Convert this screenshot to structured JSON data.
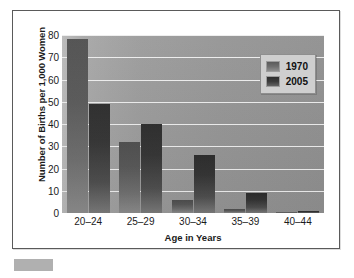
{
  "figure": {
    "background_color": "#ffffff",
    "border_color": "#5a5a5a",
    "plot_background_color": "#9a9a9a",
    "gridline_color": "#ededed"
  },
  "legend": {
    "position": "upper-right",
    "background_color": "#cfcfcf",
    "entries": [
      {
        "label": "1970",
        "color": "#6e6e6e"
      },
      {
        "label": "2005",
        "color": "#3c3c3c"
      }
    ]
  },
  "bottom_marker": {
    "name": "gray-block",
    "color": "#b0b0b0"
  },
  "chart_data": {
    "type": "bar",
    "title": "",
    "xlabel": "Age in Years",
    "ylabel": "Number of Births per 1,000 Women",
    "categories": [
      "20–24",
      "25–29",
      "30–34",
      "35–39",
      "40–44"
    ],
    "series": [
      {
        "name": "1970",
        "color": "#6e6e6e",
        "values": [
          78,
          32,
          6,
          2,
          0.5
        ]
      },
      {
        "name": "2005",
        "color": "#3c3c3c",
        "values": [
          49,
          40,
          26,
          9,
          1
        ]
      }
    ],
    "ylim": [
      0,
      80
    ],
    "yticks": [
      0,
      10,
      20,
      30,
      40,
      50,
      60,
      70,
      80
    ],
    "ytick_labels": [
      "0",
      "10",
      "20",
      "30",
      "40",
      "50",
      "60",
      "70",
      "80"
    ],
    "grid": true,
    "grid_axis": "y",
    "legend_position": "upper right"
  }
}
